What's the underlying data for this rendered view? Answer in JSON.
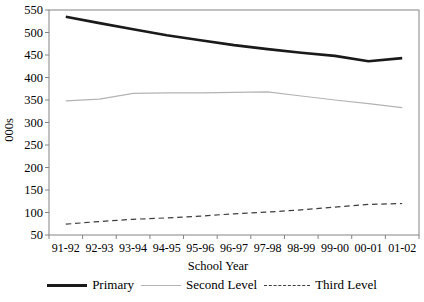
{
  "window": {
    "width": 424,
    "height": 302,
    "background": "#ffffff"
  },
  "axes": {
    "border_color": "#848484",
    "tick_color": "#848484",
    "text_color": "#000000"
  },
  "chart_data": {
    "type": "line",
    "title": "",
    "xlabel": "School Year",
    "ylabel": "000s",
    "ylim": [
      50,
      550
    ],
    "ytick_step": 50,
    "grid": false,
    "legend_position": "bottom",
    "categories": [
      "91-92",
      "92-93",
      "93-94",
      "94-95",
      "95-96",
      "96-97",
      "97-98",
      "98-99",
      "99-00",
      "00-01",
      "01-02"
    ],
    "series": [
      {
        "name": "Primary",
        "style": "solid-thick",
        "color": "#1a1a1a",
        "width": 2.6,
        "values": [
          535,
          521,
          507,
          494,
          483,
          472,
          463,
          455,
          448,
          436,
          443
        ]
      },
      {
        "name": "Second Level",
        "style": "solid-thin",
        "color": "#b3b3b3",
        "width": 1.2,
        "values": [
          348,
          352,
          365,
          366,
          366,
          367,
          368,
          359,
          350,
          342,
          333
        ]
      },
      {
        "name": "Third Level",
        "style": "dashed",
        "color": "#3d3d3d",
        "width": 1.2,
        "dash": "5.5 3.8",
        "values": [
          74,
          80,
          85,
          88,
          92,
          97,
          101,
          106,
          112,
          118,
          120
        ]
      }
    ]
  }
}
